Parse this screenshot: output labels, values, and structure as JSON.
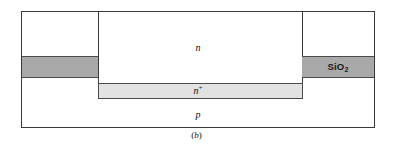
{
  "figure": {
    "caption_open": "(",
    "caption_letter": "b",
    "caption_close": ")",
    "caption_full": "(b)"
  },
  "diagram": {
    "type": "semiconductor-cross-section",
    "title": "",
    "layers": [
      {
        "id": "epitaxial-n",
        "label": "n",
        "label_style": "italic",
        "material": "n-type silicon",
        "fill": "#ffffff"
      },
      {
        "id": "buried-n-plus",
        "label": "n",
        "label_superscript": "+",
        "label_style": "italic",
        "material": "n+ buried layer",
        "fill": "#e2e2e2"
      },
      {
        "id": "substrate-p",
        "label": "p",
        "label_style": "italic",
        "material": "p-type substrate",
        "fill": "#ffffff"
      },
      {
        "id": "oxide-left",
        "label": "",
        "material": "silicon dioxide",
        "fill": "#a9a9a9"
      },
      {
        "id": "oxide-right",
        "label_text": "SiO",
        "label_subscript": "2",
        "material": "silicon dioxide",
        "fill": "#a9a9a9"
      }
    ],
    "colors": {
      "oxide": "#a9a9a9",
      "n_plus": "#e2e2e2",
      "silicon": "#ffffff",
      "outline": "#3a3a3a",
      "text": "#111111"
    }
  }
}
